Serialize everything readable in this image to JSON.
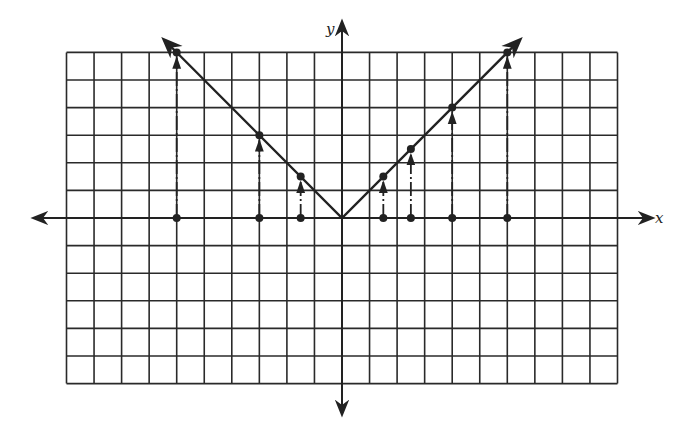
{
  "chart_data": {
    "type": "line",
    "title": "",
    "function": "y = |x|",
    "xlabel": "x",
    "ylabel": "y",
    "xlim": [
      -10,
      10
    ],
    "ylim": [
      -6,
      6
    ],
    "grid": true,
    "grid_step": 1,
    "series": [
      {
        "name": "y = |x|",
        "x": [
          -6,
          0,
          6
        ],
        "values": [
          6,
          0,
          6
        ],
        "style": "solid line with arrowheads at both ends"
      }
    ],
    "points": [
      {
        "x": -6,
        "y": 6
      },
      {
        "x": -3,
        "y": 3
      },
      {
        "x": -1.5,
        "y": 1.5
      },
      {
        "x": 1.5,
        "y": 1.5
      },
      {
        "x": 2.5,
        "y": 2.5
      },
      {
        "x": 4,
        "y": 4
      },
      {
        "x": 6,
        "y": 6
      }
    ],
    "annotations": "Dash-dot arrows drawn vertically from each x-axis point up to the corresponding point on the graph"
  },
  "labels": {
    "x_axis": "x",
    "y_axis": "y"
  },
  "colors": {
    "ink": "#222222",
    "background": "#ffffff"
  }
}
